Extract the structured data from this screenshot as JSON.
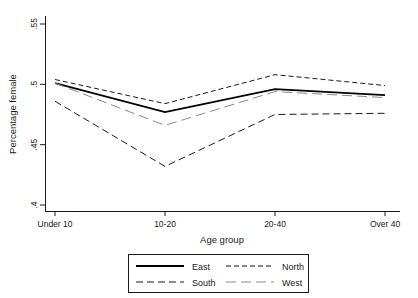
{
  "chart_data": {
    "type": "line",
    "title": "",
    "xlabel": "Age group",
    "ylabel": "Percentage female",
    "categories": [
      "Under 10",
      "10-20",
      "20-40",
      "Over 40"
    ],
    "yticks": [
      ".4",
      ".45",
      ".5",
      ".55"
    ],
    "ytick_values": [
      0.4,
      0.45,
      0.5,
      0.55
    ],
    "ylim": [
      0.4,
      0.55
    ],
    "grid": false,
    "legend_position": "bottom",
    "series": [
      {
        "name": "East",
        "values": [
          0.501,
          0.477,
          0.496,
          0.491
        ],
        "style": "solid",
        "color": "#000000",
        "width": 1.8
      },
      {
        "name": "North",
        "values": [
          0.504,
          0.484,
          0.508,
          0.499
        ],
        "style": "short-dash",
        "color": "#1a1a1a",
        "width": 1.0
      },
      {
        "name": "South",
        "values": [
          0.486,
          0.432,
          0.475,
          0.476
        ],
        "style": "medium-dash",
        "color": "#1a1a1a",
        "width": 1.0
      },
      {
        "name": "West",
        "values": [
          0.501,
          0.466,
          0.494,
          0.489
        ],
        "style": "long-dash",
        "color": "#8a8a8a",
        "width": 1.0
      }
    ]
  },
  "axes": {
    "y_label": "Percentage female",
    "x_label": "Age group",
    "y_tick_labels": [
      ".55",
      ".5",
      ".45",
      ".4"
    ],
    "x_tick_labels": [
      "Under 10",
      "10-20",
      "20-40",
      "Over 40"
    ]
  },
  "legend": {
    "entries": [
      {
        "label": "East",
        "style": "solid"
      },
      {
        "label": "North",
        "style": "short-dash"
      },
      {
        "label": "South",
        "style": "medium-dash"
      },
      {
        "label": "West",
        "style": "long-dash"
      }
    ]
  }
}
